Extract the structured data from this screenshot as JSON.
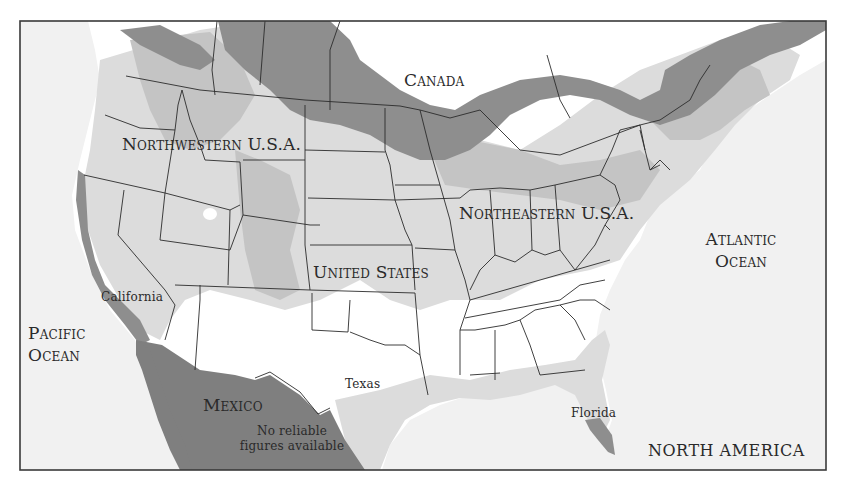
{
  "map": {
    "title": "NORTH AMERICA",
    "colors": {
      "water": "#f1f1f1",
      "land_none": "#ffffff",
      "shade_light": "#dcdcdc",
      "shade_medium": "#c4c4c4",
      "shade_dark": "#8e8e8e",
      "border": "#2b2b2b",
      "frame": "#3a3a3a"
    },
    "labels": {
      "canada": "Canada",
      "northwestern": "Northwestern U.S.A.",
      "northeastern": "Northeastern U.S.A.",
      "united_states": "United States",
      "atlantic_1": "Atlantic",
      "atlantic_2": "Ocean",
      "pacific_1": "Pacific",
      "pacific_2": "Ocean",
      "california": "California",
      "texas": "Texas",
      "florida": "Florida",
      "mexico": "Mexico",
      "mexico_note_1": "No reliable",
      "mexico_note_2": "figures available",
      "north_america": "NORTH AMERICA"
    }
  }
}
